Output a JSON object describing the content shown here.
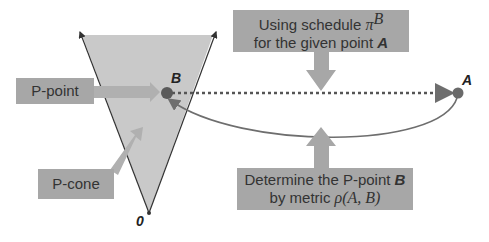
{
  "boxes": {
    "p_point": "P-point",
    "p_cone": "P-cone",
    "schedule_line1": "Using schedule",
    "schedule_pi": "π",
    "schedule_sup": "B",
    "schedule_line2": "for the given point",
    "schedule_point": "A",
    "determine_line1": "Determine the P-point",
    "determine_point": "B",
    "determine_line2": "by metric",
    "determine_metric": "ρ(A, B)"
  },
  "labels": {
    "point_a": "A",
    "point_b": "B",
    "origin": "0"
  },
  "colors": {
    "box": "#a7a7a7",
    "cone": "#c9c9c9",
    "point": "#5a5a5a",
    "line": "#6e6e6e"
  }
}
